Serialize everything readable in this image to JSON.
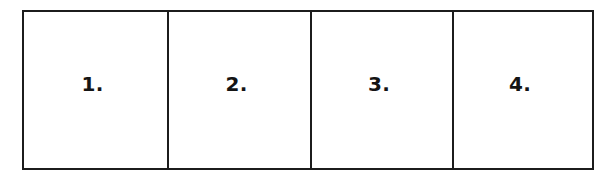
{
  "figure": {
    "kind": "four-panel-numbered-frame",
    "background_color": "#ffffff",
    "rule_color": "#1c1c1c",
    "text_color": "#141414",
    "panels": [
      {
        "label": "1."
      },
      {
        "label": "2."
      },
      {
        "label": "3."
      },
      {
        "label": "4."
      }
    ]
  }
}
